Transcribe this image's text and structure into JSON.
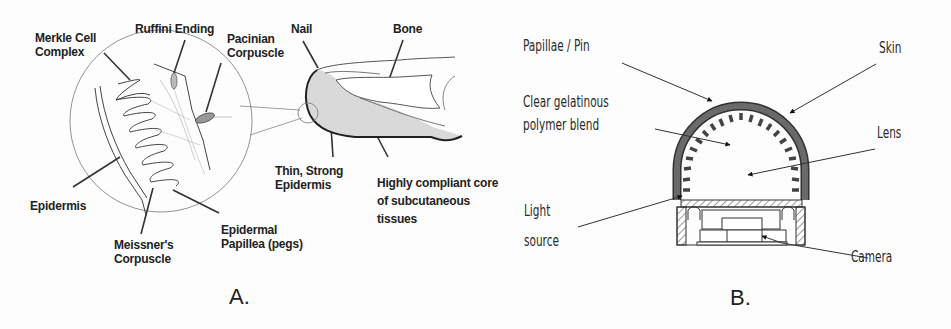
{
  "figure": {
    "panel_a": {
      "caption": "A.",
      "labels": {
        "merkle": "Merkle Cell\nComplex",
        "ruffini": "Ruffini Ending",
        "pacinian": "Pacinian\nCorpuscle",
        "nail": "Nail",
        "bone": "Bone",
        "epidermis": "Epidermis",
        "meissner": "Meissner's\nCorpuscle",
        "papillea": "Epidermal\nPapillea (pegs)",
        "thin_epidermis": "Thin, Strong\nEpidermis",
        "compliant_core": "Highly compliant core\nof subcutaneous\ntissues"
      }
    },
    "panel_b": {
      "caption": "B.",
      "labels": {
        "papillae": "Papillae / Pin",
        "gel": "Clear gelatinous\npolymer blend",
        "skin": "Skin",
        "lens": "Lens",
        "light": "Light\nsource",
        "camera": "Camera"
      }
    },
    "colors": {
      "ink": "#222222",
      "tissue_fill": "#d9d9d9",
      "skin_fill": "#5a5a5a"
    }
  }
}
